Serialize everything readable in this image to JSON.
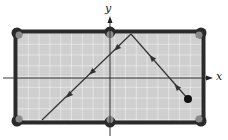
{
  "diagram": {
    "type": "billiard-table-reflection",
    "axes": {
      "x_label": "x",
      "y_label": "y"
    },
    "table": {
      "felt_color": "#cfcfcf",
      "grid_color": "#ffffff",
      "rail_color": "#2a2a2a",
      "pocket_color": "#8a8a8a",
      "grid_columns": 17,
      "grid_rows": 8
    },
    "ball": {
      "color": "#111111",
      "label": "ball"
    },
    "path": {
      "description": "Ball travels up-left, bounces off top cushion, then travels down-left toward bottom-left",
      "segments": [
        {
          "from": "ball",
          "to": "top-cushion-bounce"
        },
        {
          "from": "top-cushion-bounce",
          "to": "bottom-left"
        }
      ],
      "line_color": "#333333"
    }
  }
}
